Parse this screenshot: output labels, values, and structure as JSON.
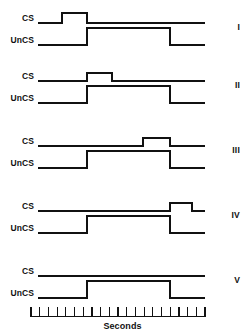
{
  "figure": {
    "title": "",
    "row_labels": {
      "cs": "CS",
      "uncs": "UnCS"
    },
    "axis_caption": "Seconds",
    "line_color": "#111111",
    "background_color": "#ffffff"
  },
  "chart_data": {
    "type": "line",
    "title": "",
    "xlabel": "Seconds",
    "ylabel": "",
    "xlim": [
      0,
      20
    ],
    "grid": false,
    "legend": "none",
    "x_tick_count": 21,
    "x_tick_interval": 1,
    "panels": [
      {
        "numeral": "I",
        "channels": [
          {
            "name": "CS",
            "onset": 3.6,
            "offset": 6.6,
            "level_low": 0,
            "level_high": 1
          },
          {
            "name": "UnCS",
            "onset": 6.6,
            "offset": 16.4,
            "level_low": 0,
            "level_high": 1
          }
        ]
      },
      {
        "numeral": "II",
        "channels": [
          {
            "name": "CS",
            "onset": 6.6,
            "offset": 9.6,
            "level_low": 0,
            "level_high": 1
          },
          {
            "name": "UnCS",
            "onset": 6.6,
            "offset": 16.4,
            "level_low": 0,
            "level_high": 1
          }
        ]
      },
      {
        "numeral": "III",
        "channels": [
          {
            "name": "CS",
            "onset": 13.4,
            "offset": 16.4,
            "level_low": 0,
            "level_high": 1
          },
          {
            "name": "UnCS",
            "onset": 6.6,
            "offset": 16.4,
            "level_low": 0,
            "level_high": 1
          }
        ]
      },
      {
        "numeral": "IV",
        "channels": [
          {
            "name": "CS",
            "onset": 16.4,
            "offset": 19.0,
            "level_low": 0,
            "level_high": 1
          },
          {
            "name": "UnCS",
            "onset": 6.6,
            "offset": 16.4,
            "level_low": 0,
            "level_high": 1
          }
        ]
      },
      {
        "numeral": "V",
        "channels": [
          {
            "name": "CS",
            "onset": null,
            "offset": null,
            "level_low": 0,
            "level_high": 0
          },
          {
            "name": "UnCS",
            "onset": 6.6,
            "offset": 16.4,
            "level_low": 0,
            "level_high": 1
          }
        ]
      }
    ]
  }
}
